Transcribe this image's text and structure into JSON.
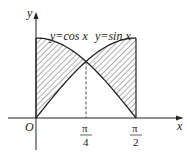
{
  "diagram": {
    "axes": {
      "x_label": "x",
      "y_label": "y",
      "origin_label": "O"
    },
    "curves": [
      {
        "name": "cos",
        "label": "y=cos x"
      },
      {
        "name": "sin",
        "label": "y=sin x"
      }
    ],
    "ticks": [
      {
        "pos": "pi/4",
        "numerator": "π",
        "denominator": "4"
      },
      {
        "pos": "pi/2",
        "numerator": "π",
        "denominator": "2"
      }
    ],
    "shading": "hatched region between y=cos x and y=sin x on [0, π/2]",
    "colors": {
      "stroke": "#222222",
      "background": "#ffffff"
    }
  }
}
